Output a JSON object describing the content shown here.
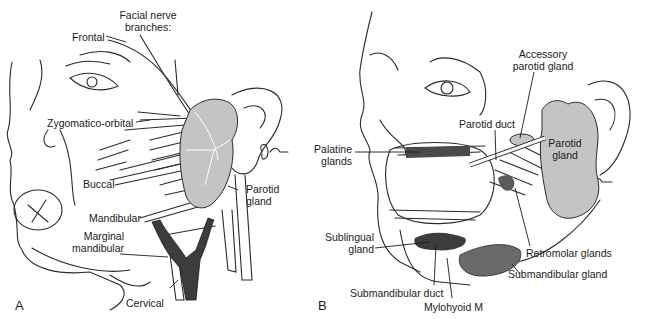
{
  "figure": {
    "panels": [
      {
        "letter": "A",
        "labels": {
          "facial_nerve_line1": "Facial nerve",
          "facial_nerve_line2": "branches:",
          "frontal": "Frontal",
          "zygomatico_orbital": "Zygomatico-orbital",
          "buccal": "Buccal",
          "mandibular": "Mandibular",
          "marginal_line1": "Marginal",
          "marginal_line2": "mandibular",
          "cervical": "Cervical",
          "parotid_line1": "Parotid",
          "parotid_line2": "gland"
        }
      },
      {
        "letter": "B",
        "labels": {
          "accessory_line1": "Accessory",
          "accessory_line2": "parotid gland",
          "parotid_duct": "Parotid duct",
          "parotid_line1": "Parotid",
          "parotid_line2": "gland",
          "palatine_line1": "Palatine",
          "palatine_line2": "glands",
          "sublingual_line1": "Sublingual",
          "sublingual_line2": "gland",
          "retromolar": "Retromolar glands",
          "submandibular_gland": "Submandibular gland",
          "submandibular_duct": "Submandibular duct",
          "mylohyoid": "Mylohyoid M"
        }
      }
    ],
    "colors": {
      "line": "#2a2a2a",
      "gland_fill": "#c4c4c4",
      "dark_structure": "#3c3c3c",
      "mid_gray": "#7a7a7a"
    }
  }
}
